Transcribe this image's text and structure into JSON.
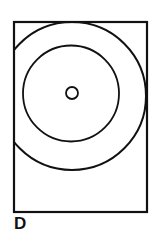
{
  "figure": {
    "caption": "D",
    "background_color": "#ffffff",
    "stroke_color": "#111111",
    "frame": {
      "name": "panel-border",
      "x": 14,
      "y": 22,
      "width": 133,
      "height": 190,
      "stroke_width": 2.2,
      "fill": "none"
    },
    "shapes": [
      {
        "name": "outer-circle",
        "type": "circle",
        "cx": 72,
        "cy": 96,
        "r": 74,
        "stroke_width": 2.0,
        "fill": "none",
        "clipped_by_frame": true
      },
      {
        "name": "middle-circle",
        "type": "circle",
        "cx": 71,
        "cy": 93.5,
        "r": 48,
        "stroke_width": 1.8,
        "fill": "none",
        "clipped_by_frame": false
      },
      {
        "name": "center-circle",
        "type": "circle",
        "cx": 72,
        "cy": 93,
        "r": 6,
        "stroke_width": 1.8,
        "fill": "none",
        "clipped_by_frame": false
      }
    ]
  },
  "chart_data": {
    "type": "diagram",
    "title": "D",
    "series": [
      {
        "name": "outer-circle",
        "cx": 72,
        "cy": 96,
        "r": 74
      },
      {
        "name": "middle-circle",
        "cx": 71,
        "cy": 93.5,
        "r": 48
      },
      {
        "name": "center-circle",
        "cx": 72,
        "cy": 93,
        "r": 6
      }
    ],
    "legend": [],
    "xlabel": "",
    "ylabel": "",
    "grid": false
  }
}
